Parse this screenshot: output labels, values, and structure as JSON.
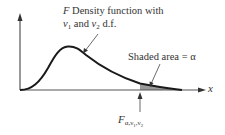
{
  "figure": {
    "title_line1_prefix": "F",
    "title_line1_rest": " Density function with",
    "title_line2_nu1": "ν",
    "title_line2_sub1": "1",
    "title_line2_mid": " and ",
    "title_line2_nu2": "ν",
    "title_line2_sub2": "2",
    "title_line2_rest": " d.f.",
    "shaded_label": "Shaded area = α",
    "x_axis_label": "x",
    "critical_value": {
      "main": "F",
      "sub": "α,ν",
      "sub1": "1",
      "comma": ",ν",
      "sub2": "2"
    }
  },
  "colors": {
    "curve": "#1a1a1a",
    "axis": "#333333",
    "shade": "#9a9a9a",
    "text": "#333333"
  }
}
